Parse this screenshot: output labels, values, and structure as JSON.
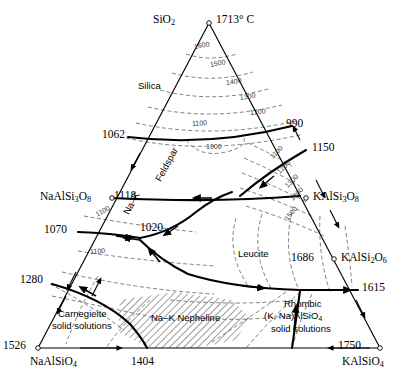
{
  "diagram": {
    "type": "ternary-phase-diagram",
    "colors": {
      "line": "#000000",
      "isotherm": "#555555",
      "hatch": "#000000",
      "background": "#ffffff"
    }
  },
  "corners": {
    "top": {
      "formula_main": "SiO",
      "formula_sub": "2",
      "temperature": "1713° C"
    },
    "bottom_left": {
      "formula_main": "NaAlSiO",
      "formula_sub": "4",
      "temperature": "1526"
    },
    "bottom_right": {
      "formula_main": "KAlSiO",
      "formula_sub": "4",
      "temperature": "1750"
    }
  },
  "edge_compounds": {
    "albite": {
      "main_a": "NaAlSi",
      "sub_a": "3",
      "main_b": "O",
      "sub_b": "8"
    },
    "orthoclase": {
      "main_a": "KAlSi",
      "sub_a": "3",
      "main_b": "O",
      "sub_b": "8"
    },
    "leucite_cmp": {
      "main_a": "KAlSi",
      "sub_a": "2",
      "main_b": "O",
      "sub_b": "6",
      "temperature": "1686"
    }
  },
  "invariant_points": [
    {
      "label": "1062",
      "x": 128,
      "y": 135
    },
    {
      "label": "990",
      "x": 292,
      "y": 124
    },
    {
      "label": "1150",
      "x": 306,
      "y": 148
    },
    {
      "label": "1118",
      "x": 112,
      "y": 196
    },
    {
      "label": "1070",
      "x": 70,
      "y": 230
    },
    {
      "label": "1020",
      "x": 138,
      "y": 233
    },
    {
      "label": "1280",
      "x": 47,
      "y": 281
    },
    {
      "label": "1404",
      "x": 147,
      "y": 356
    },
    {
      "label": "1615",
      "x": 358,
      "y": 288
    },
    {
      "label": "1686",
      "x": 326,
      "y": 259
    }
  ],
  "fields": [
    {
      "name": "Silica",
      "x": 160,
      "y": 86,
      "rotate": 0
    },
    {
      "name": "Leucite",
      "x": 262,
      "y": 254,
      "rotate": 0
    },
    {
      "name": "Feldspar",
      "x": 175,
      "y": 180,
      "rotate": -62
    },
    {
      "name": "Na–K",
      "x": 141,
      "y": 212,
      "rotate": -62
    },
    {
      "name": "Na–K Nepheline",
      "x": 200,
      "y": 318,
      "rotate": 0
    },
    {
      "name": "Carnegieite",
      "x": 62,
      "y": 314,
      "rotate": 0
    },
    {
      "name": "solid solutions",
      "x": 57,
      "y": 325,
      "rotate": 0
    },
    {
      "name": "Rhombic",
      "x": 281,
      "y": 303,
      "rotate": 0
    },
    {
      "name": "(K, Na)AlSiO",
      "x": 268,
      "y": 315,
      "rotate": 0,
      "sub": "4"
    },
    {
      "name": "solid solutions",
      "x": 272,
      "y": 327,
      "rotate": 0
    }
  ],
  "isotherm_labels": [
    {
      "value": "1600",
      "x": 202,
      "y": 47,
      "rotate": -10
    },
    {
      "value": "1500",
      "x": 214,
      "y": 65,
      "rotate": -10
    },
    {
      "value": "1400",
      "x": 232,
      "y": 82,
      "rotate": -8
    },
    {
      "value": "1300",
      "x": 244,
      "y": 97,
      "rotate": -8
    },
    {
      "value": "1200",
      "x": 253,
      "y": 112,
      "rotate": -6
    },
    {
      "value": "1100",
      "x": 198,
      "y": 123,
      "rotate": -4
    },
    {
      "value": "1000",
      "x": 213,
      "y": 146,
      "rotate": 0
    },
    {
      "value": "1100",
      "x": 276,
      "y": 157,
      "rotate": -46
    },
    {
      "value": "1200",
      "x": 283,
      "y": 172,
      "rotate": -46
    },
    {
      "value": "1300",
      "x": 291,
      "y": 186,
      "rotate": -46
    },
    {
      "value": "1400",
      "x": 296,
      "y": 199,
      "rotate": -46
    },
    {
      "value": "1500",
      "x": 291,
      "y": 219,
      "rotate": -52
    },
    {
      "value": "1100",
      "x": 101,
      "y": 214,
      "rotate": -28
    },
    {
      "value": "1100",
      "x": 95,
      "y": 251,
      "rotate": -4
    }
  ],
  "legend": {
    "system": "NaAlSiO4 – KAlSiO4 – SiO2"
  }
}
